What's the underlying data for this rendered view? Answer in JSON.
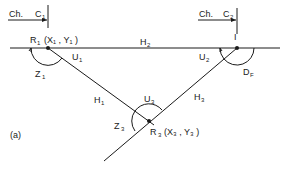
{
  "figure_label": "(a)",
  "chainage": [
    {
      "prefix": "Ch.",
      "letter": "C",
      "sub": "1"
    },
    {
      "prefix": "Ch.",
      "letter": "C",
      "sub": "2"
    }
  ],
  "points": {
    "R1": {
      "name": "R",
      "sub": "1",
      "coords": "(X₁ , Y₁ )"
    },
    "I": {
      "name": "I"
    },
    "R3": {
      "name": "R",
      "sub": "3",
      "coords": "(X₃ , Y₃ )"
    }
  },
  "segments": {
    "H1": {
      "letter": "H",
      "sub": "1"
    },
    "H2": {
      "letter": "H",
      "sub": "2"
    },
    "H3": {
      "letter": "H",
      "sub": "3"
    }
  },
  "angles": {
    "Z1": {
      "letter": "Z",
      "sub": "1"
    },
    "U1": {
      "letter": "U",
      "sub": "1"
    },
    "U2": {
      "letter": "U",
      "sub": "2"
    },
    "DF": {
      "letter": "D",
      "sub": "F"
    },
    "U3": {
      "letter": "U",
      "sub": "3"
    },
    "Z3": {
      "letter": "Z",
      "sub": "3"
    }
  }
}
